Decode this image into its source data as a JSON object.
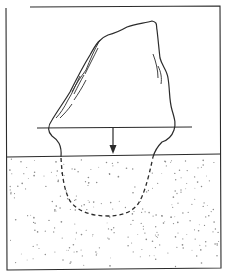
{
  "figure": {
    "type": "line-illustration",
    "elements": {
      "frame": "rectangular border",
      "object": "irregular rock / boulder with hatching on flanks",
      "reference_line": "horizontal line through base of rock",
      "arrow": "downward-pointing arrow",
      "substrate": "stippled granular layer (lower half)",
      "buried_outline": "dashed U-shaped curve"
    },
    "colors": {
      "ink": "#2b2b2b",
      "stipple": "#8a8a8a",
      "background": "#ffffff"
    },
    "text": []
  }
}
